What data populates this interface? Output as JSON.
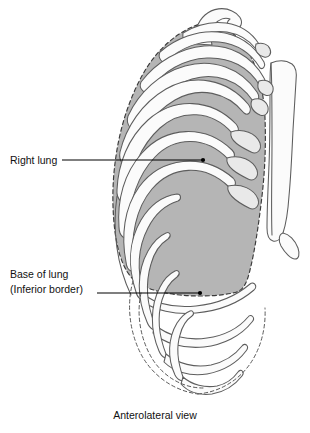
{
  "figure": {
    "caption": "Anterolateral view",
    "background_color": "#ffffff",
    "lung_fill_color": "#b5b5b5",
    "bone_fill_color": "#fbfbfb",
    "bone_outline_color": "#5d5d5d",
    "leader_color": "#000000"
  },
  "labels": [
    {
      "id": "right-lung",
      "line1": "Right lung",
      "line2": "",
      "text_x": 10,
      "text_y": 164,
      "leader_x1": 62,
      "leader_y1": 160,
      "leader_x2": 203,
      "leader_y2": 160
    },
    {
      "id": "base-of-lung",
      "line1": "Base of lung",
      "line2": "(Inferior border)",
      "text_x": 10,
      "text_y": 278,
      "text_y2": 293,
      "leader_x1": 97,
      "leader_y1": 293,
      "leader_x2": 200,
      "leader_y2": 293
    }
  ],
  "structures": [
    {
      "name": "clavicle",
      "type": "bone"
    },
    {
      "name": "sternum",
      "type": "bone"
    },
    {
      "name": "xiphoid-process",
      "type": "bone"
    },
    {
      "name": "costal-cartilage",
      "type": "bone"
    },
    {
      "name": "ribs-upper-shaded",
      "type": "bone",
      "count": 8
    },
    {
      "name": "ribs-lower-costal-margin",
      "type": "bone",
      "count": 4
    },
    {
      "name": "right-lung",
      "type": "organ"
    },
    {
      "name": "lung-inferior-border",
      "type": "dashed-outline"
    }
  ]
}
